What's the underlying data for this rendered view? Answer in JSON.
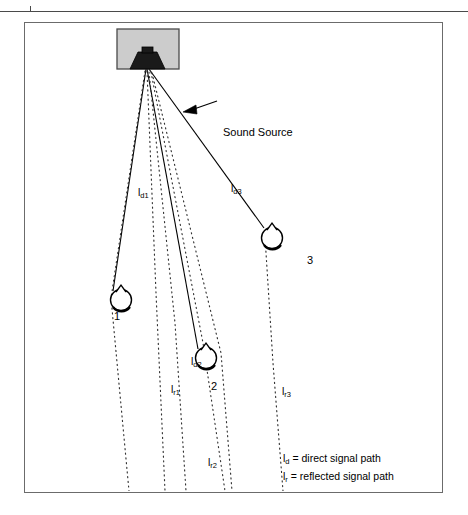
{
  "figure": {
    "title_annotation": "Sound Source",
    "source": {
      "name": "loudspeaker",
      "box_fill": "#cccccc",
      "box_stroke": "#4a4a4a"
    },
    "microphones": [
      {
        "id": "1",
        "label": "1"
      },
      {
        "id": "2",
        "label": "2"
      },
      {
        "id": "3",
        "label": "3"
      }
    ],
    "direct_paths": [
      {
        "id": "ld1",
        "label_main": "l",
        "label_sub": "d1"
      },
      {
        "id": "ld2",
        "label_main": "l",
        "label_sub": "d2"
      },
      {
        "id": "ld3",
        "label_main": "l",
        "label_sub": "d3"
      }
    ],
    "reflected_paths": [
      {
        "id": "lr1",
        "label_main": "l",
        "label_sub": "r1"
      },
      {
        "id": "lr2",
        "label_main": "l",
        "label_sub": "r2"
      },
      {
        "id": "lr3",
        "label_main": "l",
        "label_sub": "r3"
      }
    ],
    "legend": {
      "line1_symbol": "l",
      "line1_sub": "d",
      "line1_text": "= direct signal path",
      "line2_symbol": "l",
      "line2_sub": "r",
      "line2_text": "= reflected signal path"
    },
    "colors": {
      "line": "#000000",
      "frame": "#6b6b6b",
      "rule": "#4a4a4a",
      "speaker_fill": "#cccccc"
    }
  }
}
